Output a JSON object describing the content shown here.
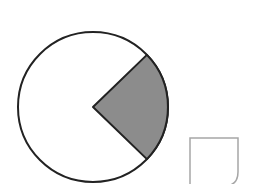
{
  "diagram": {
    "circle": {
      "cx": 93,
      "cy": 107,
      "r": 75,
      "stroke": "#222222",
      "fill": "#ffffff"
    },
    "sector": {
      "start_deg": -44,
      "end_deg": 44,
      "fill": "#8c8c8c",
      "stroke": "#222222",
      "fraction": "1/4"
    },
    "square": {
      "x": 189,
      "y": 137,
      "w": 49,
      "h": 50,
      "stroke": "#a6a6a6",
      "corner": "rounded bottom-right"
    }
  }
}
